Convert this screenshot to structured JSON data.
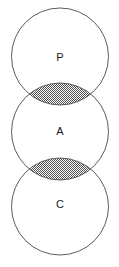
{
  "figure": {
    "kind": "venn-diagram",
    "width": 119,
    "height": 267,
    "background_color": "#ffffff",
    "stroke_color": "#4a4a4a",
    "stroke_width": 0.9,
    "label_color": "#1a1a1a",
    "fill_pattern": "checkerboard-dither-50",
    "fill_pattern_dark": "#4f4f4f",
    "fill_pattern_light": "#ffffff"
  },
  "circles": [
    {
      "id": "set-p",
      "label": "P",
      "cx": 60,
      "cy": 56.5,
      "r": 48.5,
      "label_x": 60,
      "label_y": 58
    },
    {
      "id": "set-a",
      "label": "A",
      "cx": 60,
      "cy": 131.5,
      "r": 48.5,
      "label_x": 60,
      "label_y": 132
    },
    {
      "id": "set-c",
      "label": "C",
      "cx": 60,
      "cy": 206.5,
      "r": 48.5,
      "label_x": 60,
      "label_y": 205
    }
  ],
  "intersections": [
    {
      "id": "lens-p-a",
      "between": "P and A",
      "label": "",
      "center_x": 60,
      "center_y": 94,
      "half_width": 32,
      "half_height": 11,
      "shaded": true
    },
    {
      "id": "lens-a-c",
      "between": "A and C",
      "label": "",
      "center_x": 60,
      "center_y": 169,
      "half_width": 32,
      "half_height": 11,
      "shaded": true
    }
  ]
}
